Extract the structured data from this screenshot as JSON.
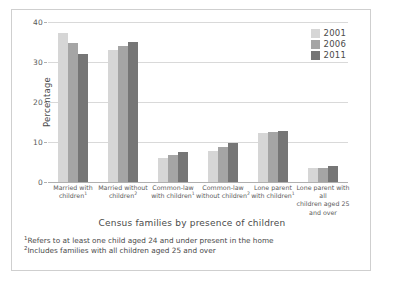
{
  "chart_data": {
    "type": "bar",
    "title": "",
    "xlabel": "Census families by presence of children",
    "ylabel": "Percentage",
    "ylim": [
      0,
      40
    ],
    "yticks": [
      0,
      10,
      20,
      30,
      40
    ],
    "grid": true,
    "legend_position": "top-right",
    "categories": [
      "Married with children¹",
      "Married without children²",
      "Common-law with children¹",
      "Common-law without children²",
      "Lone parent with children¹",
      "Lone parent with all children aged 25 and over"
    ],
    "category_lines": [
      [
        "Married with",
        "children",
        "1"
      ],
      [
        "Married without",
        "children",
        "2"
      ],
      [
        "Common-law",
        "with children",
        "1"
      ],
      [
        "Common-law",
        "without children",
        "2"
      ],
      [
        "Lone parent",
        "with children",
        "1"
      ],
      [
        "Lone parent with all",
        "children aged 25",
        "and over"
      ]
    ],
    "series": [
      {
        "name": "2001",
        "color": "#d6d6d6",
        "values": [
          37.3,
          33.1,
          6.1,
          7.8,
          12.3,
          3.5
        ]
      },
      {
        "name": "2006",
        "color": "#a5a5a5",
        "values": [
          34.8,
          34.1,
          6.8,
          8.8,
          12.6,
          3.5
        ]
      },
      {
        "name": "2011",
        "color": "#767676",
        "values": [
          31.9,
          35.1,
          7.5,
          9.8,
          12.7,
          4.0
        ]
      }
    ],
    "annotations": [
      "1Refers to at least one child aged 24 and under present in the home",
      "2Includes families with all children aged 25 and over"
    ]
  },
  "legend": {
    "entries": [
      {
        "label": "2001",
        "color": "#d6d6d6"
      },
      {
        "label": "2006",
        "color": "#a5a5a5"
      },
      {
        "label": "2011",
        "color": "#767676"
      }
    ]
  },
  "footnotes": [
    {
      "marker": "1",
      "text": "Refers to at least one child aged 24 and under present in the home"
    },
    {
      "marker": "2",
      "text": "Includes families with all children aged 25 and over"
    }
  ]
}
